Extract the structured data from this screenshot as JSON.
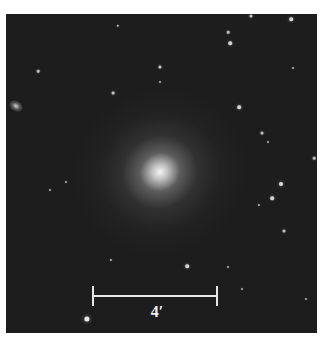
{
  "image": {
    "subject": "elliptical galaxy field",
    "background_color": "#1d1d1d",
    "frame_color": "#ffffff"
  },
  "scale_bar": {
    "label": "4′",
    "color": "#e6e6e6"
  },
  "stars": [
    {
      "x": 245,
      "y": 2,
      "r": 1.5
    },
    {
      "x": 285,
      "y": 5,
      "r": 1.8
    },
    {
      "x": 222,
      "y": 18,
      "r": 1.3
    },
    {
      "x": 224,
      "y": 29,
      "r": 1.8
    },
    {
      "x": 112,
      "y": 12,
      "r": 1.2
    },
    {
      "x": 32,
      "y": 57,
      "r": 1.3
    },
    {
      "x": 154,
      "y": 53,
      "r": 1.6
    },
    {
      "x": 107,
      "y": 79,
      "r": 1.4
    },
    {
      "x": 233,
      "y": 93,
      "r": 1.8
    },
    {
      "x": 154,
      "y": 68,
      "r": 1.0
    },
    {
      "x": 287,
      "y": 54,
      "r": 1.0
    },
    {
      "x": 256,
      "y": 119,
      "r": 1.5
    },
    {
      "x": 262,
      "y": 128,
      "r": 1.0
    },
    {
      "x": 308,
      "y": 144,
      "r": 1.3
    },
    {
      "x": 275,
      "y": 170,
      "r": 2.0
    },
    {
      "x": 266,
      "y": 184,
      "r": 1.8
    },
    {
      "x": 253,
      "y": 191,
      "r": 1.1
    },
    {
      "x": 278,
      "y": 217,
      "r": 1.5
    },
    {
      "x": 181,
      "y": 252,
      "r": 1.8
    },
    {
      "x": 105,
      "y": 246,
      "r": 1.1
    },
    {
      "x": 44,
      "y": 176,
      "r": 1.0
    },
    {
      "x": 60,
      "y": 168,
      "r": 1.0
    },
    {
      "x": 81,
      "y": 305,
      "r": 2.6
    },
    {
      "x": 222,
      "y": 253,
      "r": 1.0
    },
    {
      "x": 300,
      "y": 285,
      "r": 1.0
    },
    {
      "x": 236,
      "y": 275,
      "r": 1.0
    }
  ]
}
